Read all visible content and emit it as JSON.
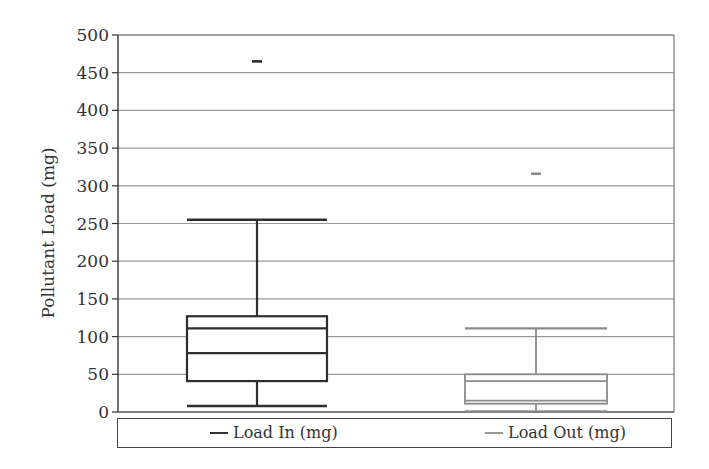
{
  "chart_data": {
    "type": "box",
    "title": "",
    "xlabel": "",
    "ylabel": "Pollutant Load (mg)",
    "ylim": [
      0,
      500
    ],
    "yticks": [
      0,
      50,
      100,
      150,
      200,
      250,
      300,
      350,
      400,
      450,
      500
    ],
    "grid": {
      "horizontal": true,
      "vertical": false
    },
    "legend_position": "bottom",
    "series": [
      {
        "name": "Load In (mg)",
        "color": "#333333",
        "whisker_low": 8,
        "q1": 41,
        "median": 78,
        "mean": 111,
        "q3": 127,
        "whisker_high": 255,
        "outliers": [
          465
        ]
      },
      {
        "name": "Load Out (mg)",
        "color": "#888888",
        "whisker_low": 1,
        "q1": 11,
        "median": 15,
        "mean": 41,
        "q3": 50,
        "whisker_high": 111,
        "outliers": [
          316
        ]
      }
    ]
  },
  "legend": {
    "items": [
      {
        "label": "Load In (mg)",
        "color": "#333333"
      },
      {
        "label": "Load Out (mg)",
        "color": "#888888"
      }
    ]
  }
}
